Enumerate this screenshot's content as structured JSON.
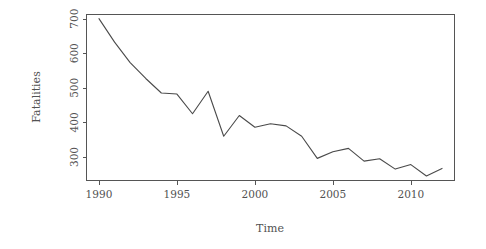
{
  "chart_data": {
    "type": "line",
    "title": "",
    "xlabel": "Time",
    "ylabel": "Fatalities",
    "xlim": [
      1989.2,
      2012.8
    ],
    "ylim": [
      232,
      712
    ],
    "grid": false,
    "legend": null,
    "x": [
      1990,
      1991,
      1992,
      1993,
      1994,
      1995,
      1996,
      1997,
      1998,
      1999,
      2000,
      2001,
      2002,
      2003,
      2004,
      2005,
      2006,
      2007,
      2008,
      2009,
      2010,
      2011,
      2012
    ],
    "xticks": [
      1990,
      1995,
      2000,
      2005,
      2010
    ],
    "xtick_labels": [
      "1990",
      "1995",
      "2000",
      "2005",
      "2010"
    ],
    "yticks": [
      300,
      400,
      500,
      600,
      700
    ],
    "ytick_labels": [
      "300",
      "400",
      "500",
      "600",
      "700"
    ],
    "series": [
      {
        "name": "Fatalities",
        "color": "#4a4a4a",
        "values": [
          700,
          632,
          573,
          527,
          485,
          482,
          425,
          490,
          360,
          420,
          386,
          396,
          390,
          360,
          296,
          315,
          325,
          288,
          295,
          265,
          278,
          245,
          267
        ]
      }
    ]
  },
  "figure": {
    "axis_color": "#555555",
    "line_color": "#4a4a4a",
    "background": "#ffffff",
    "y_axis_title": "Fatalities",
    "x_axis_title": "Time"
  }
}
